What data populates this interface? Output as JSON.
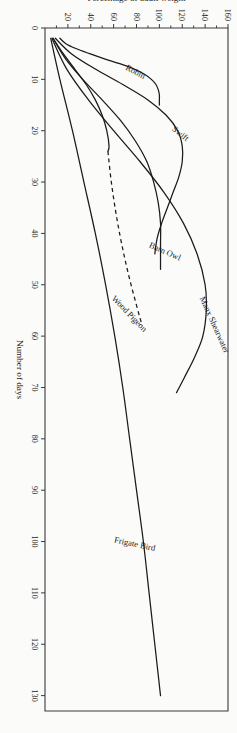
{
  "figure": {
    "page_artifact_text": "– | – | –",
    "frame": {
      "border_color": "#3b3b3b"
    }
  },
  "chart_data": {
    "type": "line",
    "title": "",
    "subtitle": "",
    "xlabel": "Number of days",
    "ylabel": "Percentage of adult weight",
    "xlim": [
      0,
      133
    ],
    "ylim": [
      0,
      160
    ],
    "grid": false,
    "legend_position": "inline-curve-labels",
    "xticks": [
      0,
      10,
      20,
      30,
      40,
      50,
      60,
      70,
      80,
      90,
      100,
      110,
      120,
      130
    ],
    "xticklabels": [
      "0",
      "10",
      "20",
      "30",
      "40",
      "50",
      "60",
      "70",
      "80",
      "90",
      "100",
      "110",
      "120",
      "130"
    ],
    "yticks": [
      20,
      40,
      60,
      80,
      100,
      120,
      140,
      160
    ],
    "yticklabels": [
      "20",
      "40",
      "60",
      "80",
      "100",
      "120",
      "140",
      "160"
    ],
    "annotations": [
      {
        "text": "Robin",
        "x": 9,
        "y": 78,
        "rotation": -62
      },
      {
        "text": "Swift",
        "x": 21,
        "y": 117,
        "rotation": -52
      },
      {
        "text": "Barn Owl",
        "x": 44,
        "y": 104,
        "rotation": -66
      },
      {
        "text": "Manx Shearwater",
        "x": 58,
        "y": 146,
        "rotation": -24
      },
      {
        "text": "Wood Pigeon",
        "x": 56,
        "y": 72,
        "rotation": -44
      },
      {
        "text": "Frigate Bird",
        "x": 101,
        "y": 78,
        "rotation": -78
      }
    ],
    "series": [
      {
        "name": "Robin",
        "style": "solid",
        "x": [
          2,
          3,
          4,
          5,
          6,
          7,
          8,
          9,
          10,
          11,
          12,
          13,
          14,
          15
        ],
        "values": [
          13,
          18,
          27,
          39,
          52,
          66,
          78,
          87,
          93,
          97,
          99,
          100,
          100,
          100
        ]
      },
      {
        "name": "Swift",
        "style": "solid",
        "x": [
          2,
          5,
          8,
          11,
          14,
          17,
          20,
          23,
          26,
          29,
          32,
          35,
          38,
          41,
          44
        ],
        "values": [
          9,
          23,
          44,
          68,
          90,
          106,
          116,
          120,
          120,
          117,
          112,
          107,
          102,
          98,
          96
        ]
      },
      {
        "name": "Barn Owl",
        "style": "solid",
        "x": [
          2,
          6,
          10,
          14,
          18,
          22,
          26,
          30,
          34,
          38,
          42,
          45,
          47
        ],
        "values": [
          7,
          18,
          33,
          50,
          66,
          79,
          89,
          95,
          99,
          101,
          101,
          101,
          101
        ]
      },
      {
        "name": "Manx Shearwater",
        "style": "solid",
        "x": [
          2,
          8,
          14,
          20,
          26,
          32,
          38,
          44,
          50,
          55,
          60,
          64,
          68,
          71
        ],
        "values": [
          6,
          19,
          38,
          60,
          83,
          104,
          121,
          133,
          140,
          141,
          138,
          131,
          122,
          115
        ]
      },
      {
        "name": "Wood Pigeon",
        "style": "solid-then-dashed",
        "dash_start_x": 24,
        "x": [
          2,
          5,
          8,
          11,
          14,
          17,
          20,
          23,
          24,
          30,
          36,
          42,
          48,
          54,
          58
        ],
        "values": [
          7,
          16,
          26,
          36,
          44,
          50,
          54,
          56,
          55,
          58,
          62,
          67,
          73,
          80,
          85
        ]
      },
      {
        "name": "Frigate Bird",
        "style": "solid",
        "x": [
          2,
          10,
          20,
          30,
          40,
          50,
          60,
          70,
          80,
          90,
          100,
          110,
          120,
          130
        ],
        "values": [
          5,
          13,
          24,
          34,
          44,
          53,
          61,
          68,
          74,
          80,
          86,
          91,
          96,
          101
        ]
      }
    ]
  }
}
